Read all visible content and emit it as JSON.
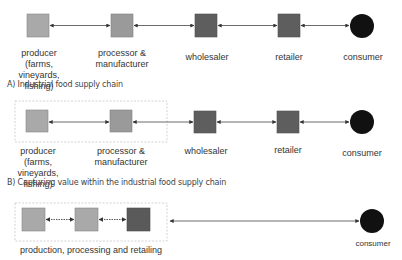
{
  "colors": {
    "light_box": "#a9a9a9",
    "mid_box": "#9a9a9a",
    "dark_box": "#5e5e5e",
    "consumer": "#111111",
    "arrow": "#444444",
    "dashed_border": "#c8c8c8"
  },
  "section_a": {
    "caption": "A) Industrial food supply chain",
    "nodes": [
      {
        "id": "producer",
        "label": "producer (farms,\nvineyards,\nfishing)"
      },
      {
        "id": "processor",
        "label": "processor &\nmanufacturer"
      },
      {
        "id": "wholesaler",
        "label": "wholesaler"
      },
      {
        "id": "retailer",
        "label": "retailer"
      },
      {
        "id": "consumer",
        "label": "consumer"
      }
    ]
  },
  "section_b": {
    "caption": "B) Capturing value within the industrial food supply chain",
    "nodes": [
      {
        "id": "producer",
        "label": "producer (farms,\nvineyards,\nfishing)"
      },
      {
        "id": "processor",
        "label": "processor &\nmanufacturer"
      },
      {
        "id": "wholesaler",
        "label": "wholesaler"
      },
      {
        "id": "retailer",
        "label": "retailer"
      },
      {
        "id": "consumer",
        "label": "consumer"
      }
    ]
  },
  "section_c": {
    "group_label": "production, processing and retailing",
    "nodes": [
      {
        "id": "production"
      },
      {
        "id": "processing"
      },
      {
        "id": "retailing"
      },
      {
        "id": "consumer",
        "label": "consumer"
      }
    ]
  }
}
